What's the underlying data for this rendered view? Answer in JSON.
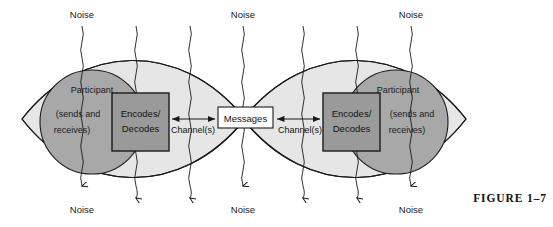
{
  "figure": {
    "caption": "FIGURE 1–7"
  },
  "colors": {
    "lens_fill": "#e6e6e6",
    "lens_overlap_fill": "#c9c9c9",
    "participant_fill": "#a8a8a8",
    "encoder_fill": "#9a9a9a",
    "message_fill": "#ffffff",
    "stroke": "#1a1a1a",
    "text": "#111111",
    "background": "#ffffff"
  },
  "participants": [
    {
      "id": "left",
      "role_label": "Participant",
      "detail_line_1": "(sends and",
      "detail_line_2": "receives)",
      "encoder_line_1": "Encodes/",
      "encoder_line_2": "Decodes"
    },
    {
      "id": "right",
      "role_label": "Participant",
      "detail_line_1": "(sends and",
      "detail_line_2": "receives)",
      "encoder_line_1": "Encodes/",
      "encoder_line_2": "Decodes"
    }
  ],
  "center": {
    "messages_label": "Messages"
  },
  "channels": [
    {
      "id": "left-channel",
      "label": "Channel(s)"
    },
    {
      "id": "right-channel",
      "label": "Channel(s)"
    }
  ],
  "noise": {
    "label": "Noise",
    "top_labels": [
      "Noise",
      "Noise",
      "Noise"
    ],
    "bottom_labels": [
      "Noise",
      "Noise",
      "Noise"
    ],
    "line_count": 7,
    "line_x_positions": [
      82,
      136,
      190,
      243,
      303,
      357,
      411
    ]
  }
}
